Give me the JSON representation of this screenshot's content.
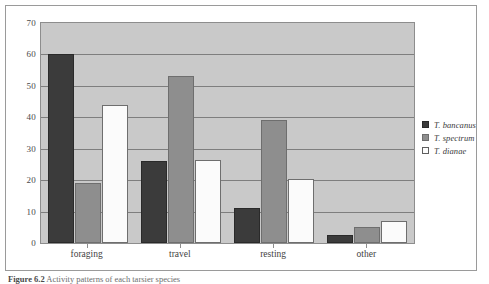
{
  "figure": {
    "caption_label": "Figure 6.2",
    "caption_text": "Activity patterns of each tarsier species"
  },
  "chart_data": {
    "type": "bar",
    "title": "",
    "xlabel": "",
    "ylabel": "",
    "ylim": [
      0,
      70
    ],
    "ytick_step": 10,
    "yticks": [
      0,
      10,
      20,
      30,
      40,
      50,
      60,
      70
    ],
    "grid": true,
    "legend_position": "right",
    "categories": [
      "foraging",
      "travel",
      "resting",
      "other"
    ],
    "series": [
      {
        "name": "T. bancanus",
        "color": "#3b3b3b",
        "values": [
          60,
          26,
          11,
          2.5
        ]
      },
      {
        "name": "T. spectrum",
        "color": "#8e8e8e",
        "values": [
          19,
          53,
          39,
          5
        ]
      },
      {
        "name": "T. dianae",
        "color": "#fbfbfb",
        "values": [
          44,
          26.5,
          20.5,
          7
        ]
      }
    ]
  },
  "colors": {
    "plot_background": "#c9c9c9",
    "gridline": "#7e7e7e",
    "frame_border": "#9a9a9a"
  }
}
